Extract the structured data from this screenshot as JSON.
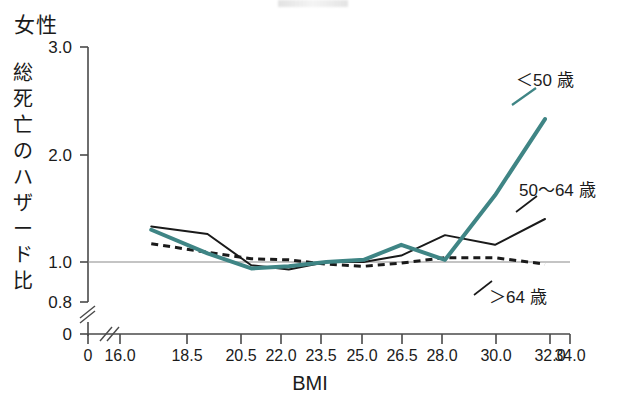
{
  "panel": {
    "title": "女性",
    "y_axis_title_chars": [
      "総",
      "死",
      "亡",
      "の",
      "ハ",
      "ザ",
      "ー",
      "ド",
      "比"
    ],
    "x_axis_title": "BMI"
  },
  "chart_data": {
    "type": "line",
    "title": "女性",
    "xlabel": "BMI",
    "ylabel": "総死亡のハザード比",
    "xlim": [
      16.0,
      34.0
    ],
    "ylim": [
      0.8,
      3.0
    ],
    "axis_break_x": true,
    "axis_break_y": true,
    "grid": false,
    "reference_line_y": 1.0,
    "legend_position": "inline-right",
    "x_ticks": [
      "0",
      "16.0",
      "18.5",
      "20.5",
      "22.0",
      "23.5",
      "25.0",
      "26.5",
      "28.0",
      "30.0",
      "32.0",
      "34.0"
    ],
    "x_tick_values": [
      16.0,
      18.5,
      20.5,
      22.0,
      23.5,
      25.0,
      26.5,
      28.0,
      30.0,
      32.0,
      34.0
    ],
    "y_ticks": [
      "3.0",
      "2.0",
      "1.0",
      "0.8",
      "0"
    ],
    "y_tick_values": [
      3.0,
      2.0,
      1.0,
      0.8
    ],
    "x": [
      17.25,
      19.5,
      21.25,
      22.75,
      24.25,
      25.75,
      27.25,
      29.0,
      31.0,
      33.0
    ],
    "series": [
      {
        "name": "<50 歳",
        "color": "#3f8585",
        "style": "solid",
        "width": 4,
        "values": [
          1.3,
          1.08,
          0.94,
          0.96,
          1.0,
          1.02,
          1.16,
          1.02,
          1.62,
          2.33
        ]
      },
      {
        "name": "50〜64 歳",
        "color": "#1a1a1a",
        "style": "solid",
        "width": 2,
        "values": [
          1.33,
          1.26,
          0.97,
          0.93,
          1.0,
          1.0,
          1.06,
          1.25,
          1.16,
          1.4
        ]
      },
      {
        "name": ">64 歳",
        "color": "#1a1a1a",
        "style": "dashed",
        "width": 3,
        "values": [
          1.17,
          1.09,
          1.03,
          1.02,
          0.98,
          0.96,
          0.99,
          1.04,
          1.04,
          0.98
        ]
      }
    ]
  },
  "annotations": [
    {
      "id": "under50",
      "text": "＜50 歳"
    },
    {
      "id": "fifty64",
      "text": "50〜64 歳"
    },
    {
      "id": "over64",
      "text": "＞64 歳"
    }
  ]
}
